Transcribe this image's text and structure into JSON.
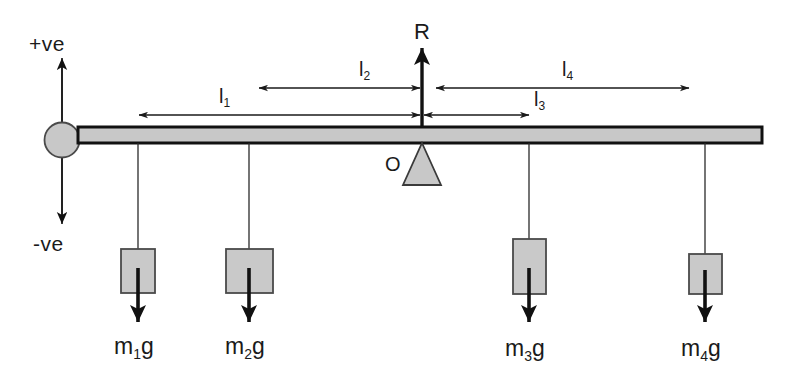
{
  "figure": {
    "background_color": "#ffffff",
    "stroke_color": "#1a1a1a",
    "fill_gray": "#c8c8c8"
  },
  "axis": {
    "positive_label": "+ve",
    "negative_label": "-ve"
  },
  "reaction": {
    "label": "R"
  },
  "pivot": {
    "label": "O"
  },
  "lengths": [
    {
      "id": "l1",
      "label": "l",
      "sub": "1"
    },
    {
      "id": "l2",
      "label": "l",
      "sub": "2"
    },
    {
      "id": "l3",
      "label": "l",
      "sub": "3"
    },
    {
      "id": "l4",
      "label": "l",
      "sub": "4"
    }
  ],
  "masses": [
    {
      "id": "m1",
      "label": "m",
      "sub": "1",
      "suffix": "g"
    },
    {
      "id": "m2",
      "label": "m",
      "sub": "2",
      "suffix": "g"
    },
    {
      "id": "m3",
      "label": "m",
      "sub": "3",
      "suffix": "g"
    },
    {
      "id": "m4",
      "label": "m",
      "sub": "4",
      "suffix": "g"
    }
  ]
}
